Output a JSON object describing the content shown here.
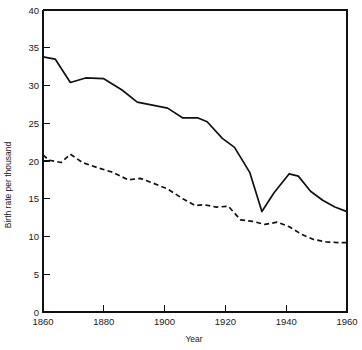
{
  "chart_data": {
    "type": "line",
    "title": "",
    "subtitle": "",
    "xlabel": "Year",
    "ylabel": "Birth rate per thousand",
    "xlim": [
      1860,
      1960
    ],
    "ylim": [
      0,
      40
    ],
    "xticks": [
      1860,
      1880,
      1900,
      1920,
      1940,
      1960
    ],
    "xtick_labels": [
      "1860",
      "1880",
      "1900",
      "1920",
      "1940",
      "1960"
    ],
    "yticks": [
      0,
      5,
      10,
      15,
      20,
      25,
      30,
      35,
      40
    ],
    "ytick_labels": [
      "0",
      "5",
      "10",
      "15",
      "20",
      "25",
      "30",
      "35",
      "40"
    ],
    "grid": false,
    "legend": "none",
    "series": [
      {
        "name": "birth-rate-solid",
        "style": "solid",
        "color": "#111111",
        "x": [
          1860,
          1864,
          1869,
          1874,
          1880,
          1886,
          1891,
          1896,
          1901,
          1906,
          1911,
          1914,
          1919,
          1923,
          1928,
          1932,
          1936,
          1941,
          1944,
          1948,
          1952,
          1956,
          1960
        ],
        "values": [
          33.8,
          33.5,
          30.4,
          31.0,
          30.9,
          29.4,
          27.8,
          27.4,
          27.0,
          25.7,
          25.7,
          25.2,
          23.0,
          21.8,
          18.5,
          13.3,
          15.8,
          18.3,
          18.0,
          16.0,
          14.8,
          13.9,
          13.3
        ]
      },
      {
        "name": "birth-rate-dashed",
        "style": "dashed",
        "color": "#111111",
        "x": [
          1860,
          1862,
          1866,
          1869,
          1873,
          1878,
          1883,
          1888,
          1892,
          1896,
          1901,
          1906,
          1910,
          1913,
          1917,
          1921,
          1925,
          1929,
          1933,
          1937,
          1941,
          1945,
          1949,
          1953,
          1957,
          1960
        ],
        "values": [
          20.8,
          20.1,
          19.8,
          20.9,
          19.8,
          19.1,
          18.5,
          17.5,
          17.7,
          17.1,
          16.3,
          15.0,
          14.1,
          14.2,
          13.9,
          14.0,
          12.2,
          12.0,
          11.6,
          11.9,
          11.3,
          10.3,
          9.6,
          9.3,
          9.2,
          9.2
        ]
      }
    ]
  },
  "axes": {
    "x_title": "Year",
    "y_title": "Birth rate per thousand"
  }
}
